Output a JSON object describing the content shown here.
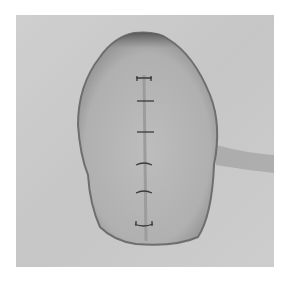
{
  "image": {
    "description": "Grayscale photograph of an oval tissue specimen with a vertical sutured incision on a light gray background",
    "stitch_count": 6,
    "colors": {
      "background": "#c9c9c9",
      "tissue": "#b4b4b4",
      "tissue_edge": "#6e6e6e",
      "suture": "#3a3a3a",
      "border": "#ffffff"
    }
  }
}
